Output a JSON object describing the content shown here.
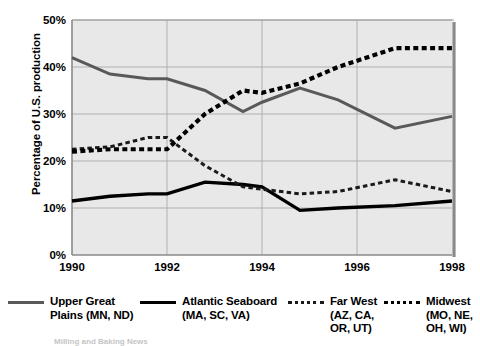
{
  "chart_data": {
    "type": "line",
    "title": "",
    "xlabel": "",
    "ylabel": "Percentage of U.S. production",
    "xlim": [
      1990,
      1998
    ],
    "ylim": [
      0,
      50
    ],
    "grid": true,
    "legend_position": "bottom",
    "x_tick_labels": [
      "1990",
      "1992",
      "1994",
      "1996",
      "1998"
    ],
    "x_tick_values": [
      1990,
      1992,
      1994,
      1996,
      1998
    ],
    "y_tick_labels": [
      "0%",
      "10%",
      "20%",
      "30%",
      "40%",
      "50%"
    ],
    "y_tick_values": [
      0,
      10,
      20,
      30,
      40,
      50
    ],
    "x": [
      1990,
      1990.8,
      1991.6,
      1992,
      1992.8,
      1993.6,
      1994,
      1994.8,
      1995.6,
      1996.8,
      1998
    ],
    "series": [
      {
        "name": "Upper Great Plains (MN, ND)",
        "style": "solid-gray",
        "color": "#595959",
        "values": [
          42.0,
          38.5,
          37.5,
          37.5,
          35.0,
          30.5,
          32.5,
          35.5,
          33.0,
          27.0,
          29.5
        ]
      },
      {
        "name": "Atlantic Seaboard (MA, SC, VA)",
        "style": "solid-black",
        "color": "#000000",
        "values": [
          11.5,
          12.5,
          13.0,
          13.0,
          15.5,
          15.0,
          14.5,
          9.5,
          10.0,
          10.5,
          11.5
        ]
      },
      {
        "name": "Far West (AZ, CA, OR, UT)",
        "style": "dashed-thin",
        "color": "#1a1a1a",
        "values": [
          22.5,
          23.0,
          25.0,
          25.0,
          19.0,
          14.5,
          14.0,
          13.0,
          13.5,
          16.0,
          13.5
        ]
      },
      {
        "name": "Midwest (MO, NE, OH, WI)",
        "style": "dashed-thick",
        "color": "#000000",
        "values": [
          22.0,
          22.5,
          22.5,
          22.5,
          30.0,
          35.0,
          34.5,
          36.5,
          40.0,
          44.0,
          44.0
        ]
      }
    ]
  },
  "axis": {
    "y_title": "Percentage of U.S. production",
    "y_ticks": [
      "50%",
      "40%",
      "30%",
      "20%",
      "10%",
      "0%"
    ],
    "x_ticks": [
      "1990",
      "1992",
      "1994",
      "1996",
      "1998"
    ]
  },
  "legend": {
    "items": [
      {
        "label": "Upper Great\nPlains (MN, ND)",
        "swatch": "solid-gray-line-icon"
      },
      {
        "label": "Atlantic Seaboard\n(MA, SC, VA)",
        "swatch": "solid-black-line-icon"
      },
      {
        "label": "Far West\n(AZ, CA,\nOR, UT)",
        "swatch": "dashed-thin-line-icon"
      },
      {
        "label": "Midwest\n(MO, NE,\nOH, WI)",
        "swatch": "dashed-thick-line-icon"
      }
    ]
  },
  "footnote": {
    "text": "Milling and Baking News"
  },
  "colors": {
    "plot_background": "#e8e8e8",
    "gridline": "#aaaaaa",
    "upper_great_plains": "#595959",
    "atlantic_seaboard": "#000000",
    "far_west": "#1a1a1a",
    "midwest": "#000000"
  }
}
